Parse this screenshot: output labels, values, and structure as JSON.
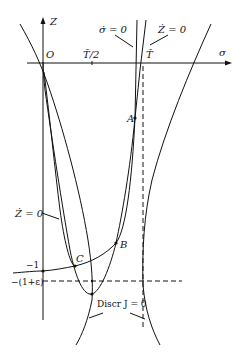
{
  "diagram": {
    "axes": {
      "x_label": "σ",
      "y_label": "Z",
      "origin_label": "O",
      "x_ticks": [
        {
          "label": "T̃/2",
          "x": 92
        },
        {
          "label": "T̃",
          "x": 143
        }
      ],
      "y_ticks": [
        {
          "label": "−1",
          "y": 271
        },
        {
          "label": "−(1+ε)",
          "y": 281
        }
      ]
    },
    "curve_labels": {
      "sigma_dot_zero": "σ̇ = 0",
      "z_dot_zero_top": "Ż = 0",
      "z_dot_zero_left": "Ż = 0",
      "discr": "Discr J = 0"
    },
    "points": {
      "A": "A",
      "B": "B",
      "C": "C"
    },
    "colors": {
      "ink": "#111111",
      "background": "#ffffff"
    }
  }
}
